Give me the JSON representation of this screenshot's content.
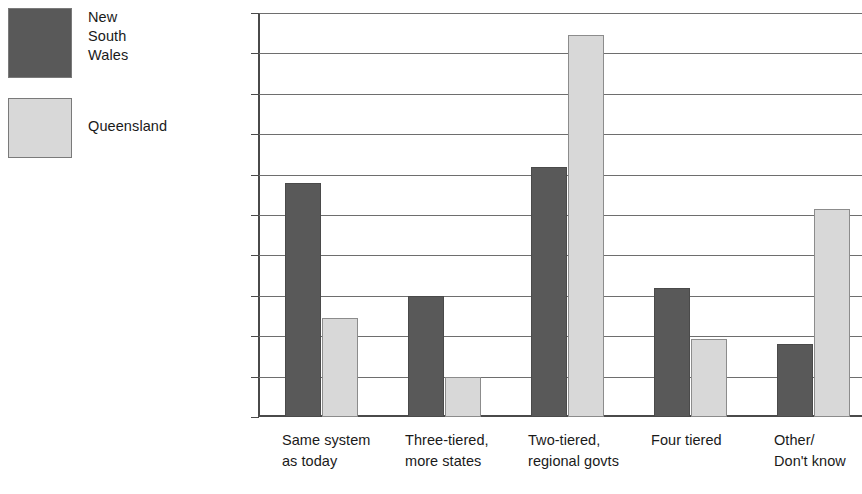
{
  "chart_data": {
    "type": "bar",
    "title": "",
    "subtitle": "",
    "xlabel": "",
    "ylabel": "",
    "ylim": [
      0,
      50
    ],
    "y_tick_labels": [
      "50%",
      "45",
      "40",
      "35",
      "30",
      "25",
      "20",
      "15",
      "10",
      "5",
      "0"
    ],
    "y_ticks": [
      50,
      45,
      40,
      35,
      30,
      25,
      20,
      15,
      10,
      5,
      0
    ],
    "grid": true,
    "grid_axis": "y",
    "legend_position": "left-outside",
    "categories": [
      "Same system\nas today",
      "Three-tiered,\nmore states",
      "Two-tiered,\nregional govts",
      "Four tiered",
      "Other/\nDon't know"
    ],
    "series": [
      {
        "name": "New\nSouth\nWales",
        "legend_label": "New\nSouth\nWales",
        "color": "#595959",
        "values": [
          29,
          15,
          31,
          16,
          9
        ]
      },
      {
        "name": "Queensland",
        "legend_label": "Queensland",
        "color": "#d8d8d8",
        "values": [
          12.3,
          5,
          47.3,
          9.6,
          25.7
        ]
      }
    ],
    "note": "Right edge of the chart is cropped by the image boundary."
  },
  "legend": {
    "items": [
      {
        "label": "New\nSouth\nWales",
        "color": "#595959"
      },
      {
        "label": "Queensland",
        "color": "#d8d8d8"
      }
    ]
  }
}
